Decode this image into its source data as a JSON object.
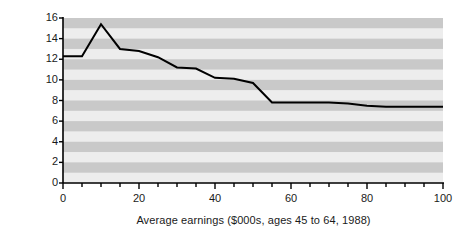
{
  "chart_data": {
    "type": "line",
    "title": "",
    "subtitle": "",
    "xlabel": "Average earnings ($000s, ages 45 to 64, 1988)",
    "ylabel": "Mortality rate (%, ages 65 to 70)",
    "xlim": [
      0,
      100
    ],
    "ylim": [
      0,
      16
    ],
    "xticks": [
      0,
      20,
      40,
      60,
      80,
      100
    ],
    "xtick_labels": [
      "0",
      "20",
      "40",
      "60",
      "80",
      "100"
    ],
    "xminor_step": 5,
    "yticks": [
      0,
      2,
      4,
      6,
      8,
      10,
      12,
      14,
      16
    ],
    "ytick_labels": [
      "0",
      "2",
      "4",
      "6",
      "8",
      "10",
      "12",
      "14",
      "16"
    ],
    "grid": false,
    "banding": "horizontal-alternating-gray",
    "legend": "none",
    "series": [
      {
        "name": "Mortality rate",
        "color": "#000000",
        "x": [
          0,
          5,
          10,
          15,
          20,
          25,
          30,
          35,
          40,
          45,
          50,
          55,
          60,
          65,
          70,
          75,
          80,
          85,
          90,
          95,
          100
        ],
        "values": [
          12.3,
          12.3,
          15.4,
          13.0,
          12.8,
          12.2,
          11.2,
          11.1,
          10.2,
          10.1,
          9.7,
          7.8,
          7.8,
          7.8,
          7.8,
          7.7,
          7.5,
          7.4,
          7.4,
          7.4,
          7.4
        ]
      }
    ]
  },
  "colors": {
    "band_light": "#ededed",
    "band_dark": "#c9c9c9",
    "line": "#000000",
    "axis": "#000000",
    "text": "#1a1a1a",
    "background": "#ffffff"
  }
}
